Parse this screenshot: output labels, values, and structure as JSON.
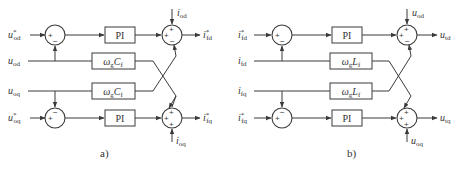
{
  "diagrams": [
    {
      "caption": "a)",
      "inputs": {
        "ref_d": {
          "base": "u",
          "sup": "*",
          "sub": "od"
        },
        "meas_d": {
          "base": "u",
          "sub": "od"
        },
        "meas_q": {
          "base": "u",
          "sub": "oq"
        },
        "ref_q": {
          "base": "u",
          "sup": "*",
          "sub": "oq"
        }
      },
      "feedforward": {
        "d": {
          "base": "i",
          "sub": "od"
        },
        "q": {
          "base": "i",
          "sub": "oq"
        }
      },
      "outputs": {
        "d": {
          "base": "i",
          "sup": "*",
          "sub": "fd"
        },
        "q": {
          "base": "i",
          "sup": "*",
          "sub": "fq"
        }
      },
      "controller_label": "PI",
      "coupling_block": {
        "omega": "ω",
        "omega_sub": "g",
        "base": "C",
        "sub": "f"
      },
      "summer1_signs": {
        "left": "+",
        "feedback": "−"
      },
      "summer2_top_signs": {
        "top": "+",
        "left": "+",
        "bottom": "−"
      },
      "summer2_bottom_signs": {
        "top": "+",
        "left": "+",
        "bottom": "+"
      }
    },
    {
      "caption": "b)",
      "inputs": {
        "ref_d": {
          "base": "i",
          "sup": "*",
          "sub": "fd"
        },
        "meas_d": {
          "base": "i",
          "sub": "fd"
        },
        "meas_q": {
          "base": "i",
          "sub": "fq"
        },
        "ref_q": {
          "base": "i",
          "sup": "*",
          "sub": "fq"
        }
      },
      "feedforward": {
        "d": {
          "base": "u",
          "sub": "od"
        },
        "q": {
          "base": "u",
          "sub": "oq"
        }
      },
      "outputs": {
        "d": {
          "base": "u",
          "sub": "td"
        },
        "q": {
          "base": "u",
          "sub": "tq"
        }
      },
      "controller_label": "PI",
      "coupling_block": {
        "omega": "ω",
        "omega_sub": "g",
        "base": "L",
        "sub": "f"
      },
      "summer1_signs": {
        "left": "+",
        "feedback": "−"
      },
      "summer2_top_signs": {
        "top": "+",
        "left": "+",
        "bottom": "−"
      },
      "summer2_bottom_signs": {
        "top": "+",
        "left": "+",
        "bottom": "+"
      }
    }
  ]
}
